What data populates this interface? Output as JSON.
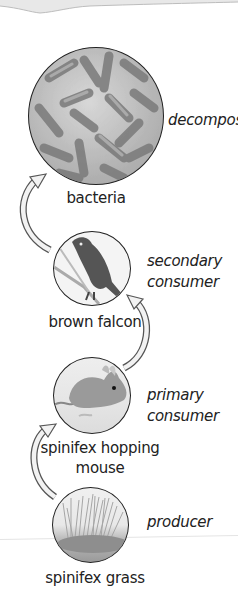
{
  "diagram": {
    "organisms": [
      {
        "id": "bacteria",
        "name": "bacteria",
        "role": "decomposer"
      },
      {
        "id": "falcon",
        "name": "brown falcon",
        "role_line1": "secondary",
        "role_line2": "consumer"
      },
      {
        "id": "mouse",
        "name_line1": "spinifex hopping",
        "name_line2": "mouse",
        "role_line1": "primary",
        "role_line2": "consumer"
      },
      {
        "id": "grass",
        "name": "spinifex grass",
        "role": "producer"
      }
    ],
    "arrows": [
      {
        "from": "spinifex grass",
        "to": "spinifex hopping mouse"
      },
      {
        "from": "spinifex hopping mouse",
        "to": "brown falcon"
      },
      {
        "from": "brown falcon",
        "to": "bacteria"
      }
    ],
    "colors": {
      "outline": "#222222",
      "arrow_fill": "#f2f2f2",
      "arrow_stroke": "#555555",
      "text": "#222222"
    }
  }
}
